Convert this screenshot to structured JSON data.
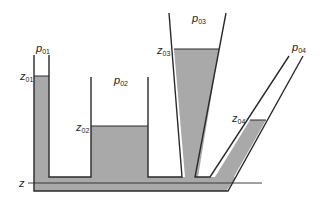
{
  "diagram": {
    "colors": {
      "fluid": "#a9a9a9",
      "wall": "#2a2a2a",
      "background": "#ffffff"
    },
    "reference_level": {
      "symbol": "z",
      "subscript": ""
    },
    "vessels": [
      {
        "id": "1",
        "pressure": {
          "symbol": "p",
          "subscript": "01"
        },
        "level": {
          "symbol": "z",
          "subscript": "01"
        }
      },
      {
        "id": "2",
        "pressure": {
          "symbol": "p",
          "subscript": "02"
        },
        "level": {
          "symbol": "z",
          "subscript": "02"
        }
      },
      {
        "id": "3",
        "pressure": {
          "symbol": "p",
          "subscript": "03"
        },
        "level": {
          "symbol": "z",
          "subscript": "03"
        }
      },
      {
        "id": "4",
        "pressure": {
          "symbol": "p",
          "subscript": "04"
        },
        "level": {
          "symbol": "z",
          "subscript": "04"
        }
      }
    ]
  }
}
